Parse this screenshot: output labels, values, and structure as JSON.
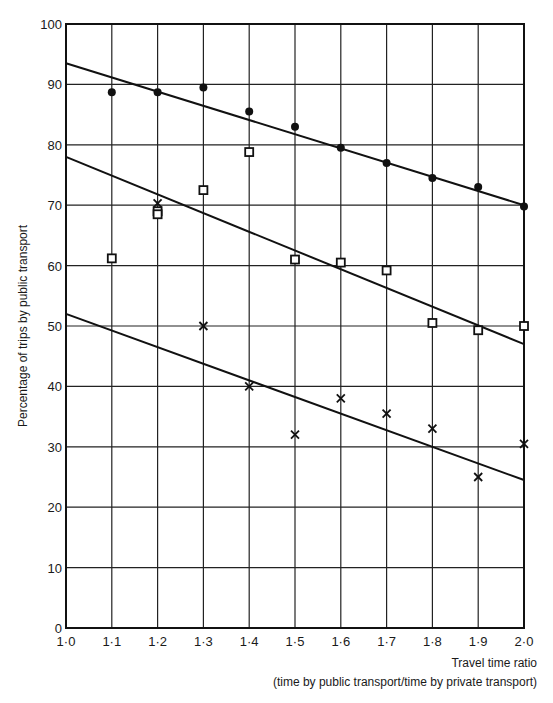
{
  "chart_data": {
    "type": "scatter",
    "title": "",
    "xlabel": "Travel time ratio",
    "xlabel_sub": "(time by public transport/time by private transport)",
    "ylabel": "Percentage of trips by public transport",
    "xlim": [
      1.0,
      2.0
    ],
    "ylim": [
      0,
      100
    ],
    "grid": true,
    "legend": "none",
    "x_ticks": [
      "1·0",
      "1·1",
      "1·2",
      "1·3",
      "1·4",
      "1·5",
      "1·6",
      "1·7",
      "1·8",
      "1·9",
      "2·0"
    ],
    "x_tick_values": [
      1.0,
      1.1,
      1.2,
      1.3,
      1.4,
      1.5,
      1.6,
      1.7,
      1.8,
      1.9,
      2.0
    ],
    "y_ticks": [
      "0",
      "10",
      "20",
      "30",
      "40",
      "50",
      "60",
      "70",
      "80",
      "90",
      "100"
    ],
    "y_tick_values": [
      0,
      10,
      20,
      30,
      40,
      50,
      60,
      70,
      80,
      90,
      100
    ],
    "series": [
      {
        "name": "dots",
        "marker": "filled-circle",
        "x": [
          1.1,
          1.2,
          1.3,
          1.4,
          1.5,
          1.6,
          1.7,
          1.8,
          1.9,
          2.0
        ],
        "y": [
          88.7,
          88.7,
          89.5,
          85.5,
          83.0,
          79.5,
          77.0,
          74.5,
          73.0,
          69.8
        ],
        "fit_line": {
          "x": [
            1.0,
            2.0
          ],
          "y": [
            93.5,
            70.0
          ]
        }
      },
      {
        "name": "squares",
        "marker": "open-square",
        "x": [
          1.1,
          1.2,
          1.2,
          1.3,
          1.4,
          1.5,
          1.6,
          1.7,
          1.8,
          1.9,
          2.0
        ],
        "y": [
          61.2,
          69.0,
          68.5,
          72.5,
          78.8,
          61.0,
          60.5,
          59.2,
          50.5,
          49.3,
          50.0
        ],
        "fit_line": {
          "x": [
            1.0,
            2.0
          ],
          "y": [
            78.0,
            47.0
          ]
        }
      },
      {
        "name": "crosses",
        "marker": "cross",
        "x": [
          1.2,
          1.3,
          1.4,
          1.5,
          1.6,
          1.7,
          1.8,
          1.9,
          2.0
        ],
        "y": [
          70.3,
          50.0,
          40.0,
          32.0,
          38.0,
          35.5,
          33.0,
          25.0,
          30.5
        ],
        "fit_line": {
          "x": [
            1.0,
            2.0
          ],
          "y": [
            52.0,
            24.5
          ]
        }
      }
    ]
  }
}
